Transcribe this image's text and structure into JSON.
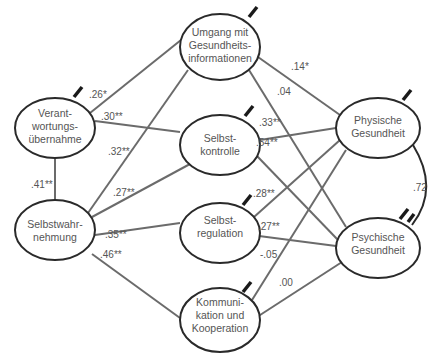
{
  "diagram": {
    "type": "structural-equation-model",
    "nodes": {
      "verant": {
        "lines": [
          "Verant-",
          "wortungs-",
          "übernahme"
        ]
      },
      "selbstwahr": {
        "lines": [
          "Selbstwahr-",
          "nehmung"
        ]
      },
      "umgang": {
        "lines": [
          "Umgang mit",
          "Gesundheits-",
          "informationen"
        ]
      },
      "selbstkontrolle": {
        "lines": [
          "Selbst-",
          "kontrolle"
        ]
      },
      "selbstregulation": {
        "lines": [
          "Selbst-",
          "regulation"
        ]
      },
      "kommunikation": {
        "lines": [
          "Kommuni-",
          "kation und",
          "Kooperation"
        ]
      },
      "physisch": {
        "lines": [
          "Physische",
          "Gesundheit"
        ]
      },
      "psychisch": {
        "lines": [
          "Psychische",
          "Gesundheit"
        ]
      }
    },
    "edges": {
      "verant_umgang": {
        "from": "Verantwortungsübernahme",
        "to": "Umgang mit Gesundheitsinformationen",
        "coef": ".26*"
      },
      "verant_kontrolle": {
        "from": "Verantwortungsübernahme",
        "to": "Selbstkontrolle",
        "coef": ".30**"
      },
      "wahr_verant": {
        "from": "Selbstwahrnehmung",
        "to": "Verantwortungsübernahme",
        "coef": ".41**"
      },
      "wahr_umgang": {
        "from": "Selbstwahrnehmung",
        "to": "Umgang mit Gesundheitsinformationen",
        "coef": ".32**"
      },
      "wahr_kontrolle": {
        "from": "Selbstwahrnehmung",
        "to": "Selbstkontrolle",
        "coef": ".27**"
      },
      "wahr_regulation": {
        "from": "Selbstwahrnehmung",
        "to": "Selbstregulation",
        "coef": ".35**"
      },
      "wahr_kommunikation": {
        "from": "Selbstwahrnehmung",
        "to": "Kommunikation und Kooperation",
        "coef": ".46**"
      },
      "umgang_physisch": {
        "from": "Umgang mit Gesundheitsinformationen",
        "to": "Physische Gesundheit",
        "coef": ".14*"
      },
      "umgang_psychisch": {
        "from": "Umgang mit Gesundheitsinformationen",
        "to": "Psychische Gesundheit",
        "coef": ".04"
      },
      "kontrolle_physisch": {
        "from": "Selbstkontrolle",
        "to": "Physische Gesundheit",
        "coef": ".33**"
      },
      "kontrolle_psychisch": {
        "from": "Selbstkontrolle",
        "to": "Psychische Gesundheit",
        "coef": ".54**"
      },
      "regulation_physisch": {
        "from": "Selbstregulation",
        "to": "Physische Gesundheit",
        "coef": ".28**"
      },
      "regulation_psychisch": {
        "from": "Selbstregulation",
        "to": "Psychische Gesundheit",
        "coef": ".27**"
      },
      "kommunikation_physisch": {
        "from": "Kommunikation und Kooperation",
        "to": "Physische Gesundheit",
        "coef": "-.05"
      },
      "kommunikation_psychisch": {
        "from": "Kommunikation und Kooperation",
        "to": "Psychische Gesundheit",
        "coef": ".00"
      },
      "physisch_psychisch": {
        "from": "Physische Gesundheit",
        "to": "Psychische Gesundheit",
        "coef": ".72",
        "kind": "correlation"
      }
    }
  }
}
